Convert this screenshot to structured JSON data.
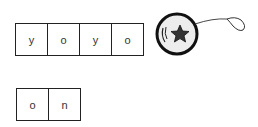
{
  "word_boxes": [
    {
      "letters": [
        "y",
        "o",
        "y",
        "o"
      ]
    },
    {
      "letters": [
        "o",
        "n"
      ]
    }
  ],
  "picture": {
    "icon": "yoyo-icon",
    "description": "yo-yo with star"
  }
}
